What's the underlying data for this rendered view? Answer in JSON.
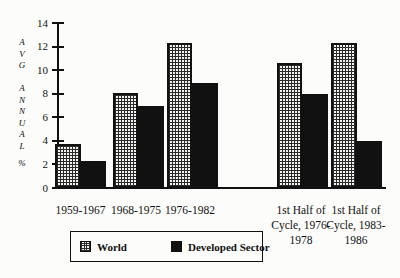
{
  "chart_data": {
    "type": "bar",
    "title": "",
    "categories": [
      "1959-1967",
      "1968-1975",
      "1976-1982",
      "1st Half of Cycle, 1976-1978",
      "1st Half of Cycle, 1983-1986"
    ],
    "categories_display": [
      [
        "1959-1967"
      ],
      [
        "1968-1975"
      ],
      [
        "1976-1982"
      ],
      [
        "1st Half of",
        "Cycle, 1976-",
        "1978"
      ],
      [
        "1st Half of",
        "Cycle, 1983-",
        "1986"
      ]
    ],
    "series": [
      {
        "name": "World",
        "fill": "checkered",
        "values": [
          3.7,
          8.1,
          12.3,
          10.6,
          12.3
        ]
      },
      {
        "name": "Developed Sector",
        "fill": "solid-black",
        "values": [
          2.3,
          7.0,
          8.9,
          8.0,
          4.0
        ]
      }
    ],
    "ylabel": "AVG ANNUAL %",
    "ylabel_stacked": [
      "AVG",
      "ANNUAL",
      "%"
    ],
    "yticks": [
      0,
      2,
      4,
      6,
      8,
      10,
      12,
      14
    ],
    "ylim": [
      0,
      14
    ],
    "grid": false,
    "legend_position": "bottom-center-boxed",
    "colors": {
      "ink": "#111111",
      "background": "#fcfcfa",
      "developed_fill": "#111111",
      "world_fill": "black-grid-on-light"
    }
  }
}
